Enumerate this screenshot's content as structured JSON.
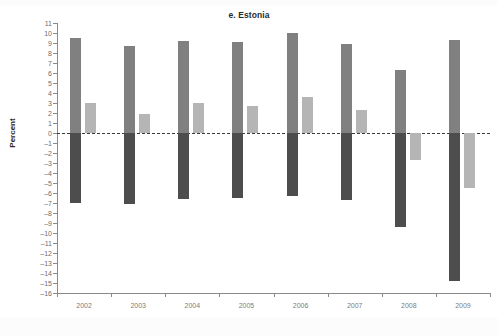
{
  "chart_data": {
    "type": "bar",
    "title": "e. Estonia",
    "xlabel": "",
    "ylabel": "Percent",
    "categories": [
      "2002",
      "2003",
      "2004",
      "2005",
      "2006",
      "2007",
      "2008",
      "2009"
    ],
    "ylim": [
      -16,
      11
    ],
    "ytick_step": 1,
    "yticks": [
      "11",
      "10",
      "9",
      "8",
      "7",
      "6",
      "5",
      "4",
      "3",
      "2",
      "1",
      "0",
      "–1",
      "–2",
      "–3",
      "–4",
      "–5",
      "–6",
      "–7",
      "–8",
      "–9",
      "–10",
      "–11",
      "–12",
      "–13",
      "–14",
      "–15",
      "–16"
    ],
    "ytick_values": [
      11,
      10,
      9,
      8,
      7,
      6,
      5,
      4,
      3,
      2,
      1,
      0,
      -1,
      -2,
      -3,
      -4,
      -5,
      -6,
      -7,
      -8,
      -9,
      -10,
      -11,
      -12,
      -13,
      -14,
      -15,
      -16
    ],
    "grid": false,
    "legend": "none",
    "zero_line": true,
    "series": [
      {
        "name": "series-1",
        "color": "#808080",
        "values": [
          9.5,
          8.7,
          9.2,
          9.1,
          10.0,
          8.9,
          6.3,
          9.3
        ]
      },
      {
        "name": "series-2",
        "color": "#4d4d4d",
        "values": [
          -7.0,
          -7.1,
          -6.6,
          -6.5,
          -6.3,
          -6.7,
          -9.4,
          -14.8
        ]
      },
      {
        "name": "series-3",
        "color": "#b5b5b5",
        "values": [
          3.0,
          1.9,
          3.0,
          2.7,
          3.6,
          2.3,
          -2.7,
          -5.5
        ]
      }
    ]
  },
  "colors": {
    "axis": "#8a8a8a",
    "tick_text": "#6e6e6e",
    "xtick_text": "#7d7d7d",
    "title_text": "#2b2b2b",
    "zero_line": "#3a3a3a",
    "background": "#ffffff"
  }
}
